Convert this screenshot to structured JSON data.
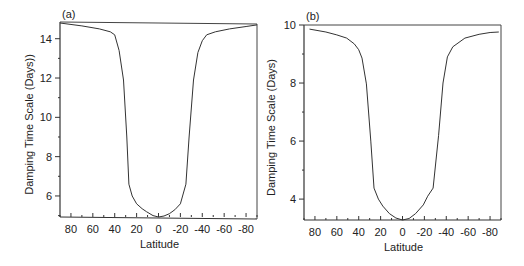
{
  "chart_data": [
    {
      "type": "line",
      "panel_label": "(a)",
      "xlabel": "Latitude",
      "ylabel": "Damping Time Scale (Days))",
      "xlim": [
        90,
        -90
      ],
      "ylim": [
        4.93,
        14.85
      ],
      "xticks": [
        80,
        60,
        40,
        20,
        0,
        -20,
        -40,
        -60,
        -80
      ],
      "xtick_labels": [
        "80",
        "60",
        "40",
        "20",
        "0",
        "-20",
        "-40",
        "-60",
        "-80"
      ],
      "yticks": [
        6,
        8,
        10,
        12,
        14
      ],
      "ytick_labels": [
        "6",
        "8",
        "10",
        "12",
        "14"
      ],
      "grid": false,
      "x": [
        90,
        70,
        54,
        44,
        40,
        36,
        32,
        29,
        27,
        24,
        20,
        15,
        11,
        5,
        0,
        -5,
        -10,
        -15,
        -20,
        -25,
        -28,
        -32,
        -36,
        -40,
        -44,
        -52,
        -65,
        -80,
        -90
      ],
      "y": [
        14.8,
        14.65,
        14.5,
        14.35,
        14.2,
        13.4,
        11.9,
        9.0,
        6.6,
        6.0,
        5.6,
        5.35,
        5.2,
        5.0,
        4.93,
        4.98,
        5.1,
        5.3,
        5.6,
        6.6,
        9.0,
        11.9,
        13.3,
        13.9,
        14.2,
        14.35,
        14.5,
        14.62,
        14.7
      ],
      "annotation": "Straight line from top-left corner to curve end at -90"
    },
    {
      "type": "line",
      "panel_label": "(b)",
      "xlabel": "Latitude",
      "ylabel": "Damping Time Scale (Days)",
      "xlim": [
        90,
        -90
      ],
      "ylim": [
        3.28,
        10.0
      ],
      "xticks": [
        80,
        60,
        40,
        20,
        0,
        -20,
        -40,
        -60,
        -80
      ],
      "xtick_labels": [
        "80",
        "60",
        "40",
        "20",
        "0",
        "-20",
        "-40",
        "-60",
        "-80"
      ],
      "yticks": [
        4,
        6,
        8,
        10
      ],
      "ytick_labels": [
        "4",
        "6",
        "8",
        "10"
      ],
      "grid": false,
      "x": [
        85,
        70,
        60,
        51,
        44,
        40,
        37,
        33,
        29,
        26,
        22,
        18,
        12,
        6,
        0,
        -6,
        -12,
        -19,
        -23,
        -28,
        -33,
        -37,
        -41,
        -46,
        -57,
        -70,
        -80,
        -88
      ],
      "y": [
        9.86,
        9.76,
        9.66,
        9.55,
        9.35,
        9.15,
        8.86,
        7.97,
        6.0,
        4.38,
        4.0,
        3.76,
        3.5,
        3.35,
        3.28,
        3.33,
        3.5,
        3.8,
        4.1,
        4.38,
        6.2,
        8.0,
        8.9,
        9.25,
        9.55,
        9.68,
        9.74,
        9.76
      ]
    }
  ]
}
